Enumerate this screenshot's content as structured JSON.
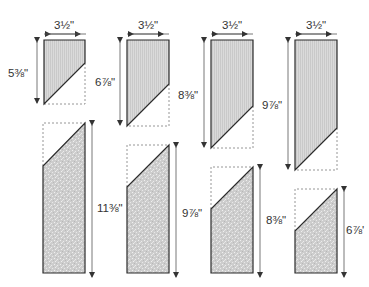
{
  "colors": {
    "outline": "#2b2b2b",
    "dashed": "#8a8a8a",
    "top_fill": "#d6d6d6",
    "bottom_fill": "#cfcfcf",
    "arrow": "#333333",
    "text": "#333333"
  },
  "columns": [
    {
      "width_label": "3½\"",
      "top_piece": {
        "height_label": "5⅜\""
      },
      "bottom_piece": {
        "height_label": "11⅜\""
      }
    },
    {
      "width_label": "3½\"",
      "top_piece": {
        "height_label": "6⅞\""
      },
      "bottom_piece": {
        "height_label": "9⅞\""
      }
    },
    {
      "width_label": "3½\"",
      "top_piece": {
        "height_label": "8⅜\""
      },
      "bottom_piece": {
        "height_label": "8⅜\""
      }
    },
    {
      "width_label": "3½\"",
      "top_piece": {
        "height_label": "9⅞\""
      },
      "bottom_piece": {
        "height_label": "6⅞'"
      }
    }
  ]
}
